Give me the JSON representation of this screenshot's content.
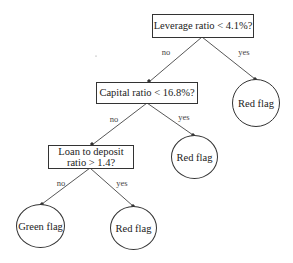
{
  "diagram": {
    "type": "decision-tree",
    "nodes": {
      "root": {
        "label": "Leverage ratio < 4.1%?"
      },
      "capital": {
        "label": "Capital ratio < 16.8%?"
      },
      "loan": {
        "label_line1": "Loan to deposit",
        "label_line2": "ratio > 1.4?"
      },
      "leaf_root_yes": {
        "label": "Red flag"
      },
      "leaf_capital_yes": {
        "label": "Red flag"
      },
      "leaf_loan_no": {
        "label": "Green flag"
      },
      "leaf_loan_yes": {
        "label": "Red flag"
      }
    },
    "edges": {
      "root_no": "no",
      "root_yes": "yes",
      "capital_no": "no",
      "capital_yes": "yes",
      "loan_no": "no",
      "loan_yes": "yes"
    }
  }
}
